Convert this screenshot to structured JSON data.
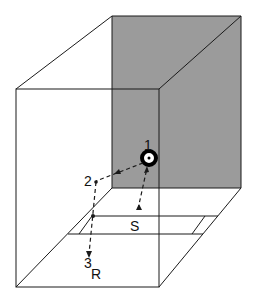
{
  "diagram": {
    "colors": {
      "wall_shade": "#9b9b9b",
      "line": "#1a1a1a",
      "background": "#ffffff"
    },
    "labels": {
      "point1": "1",
      "point2": "2",
      "point3": "3",
      "source": "S",
      "receiver": "R"
    }
  }
}
